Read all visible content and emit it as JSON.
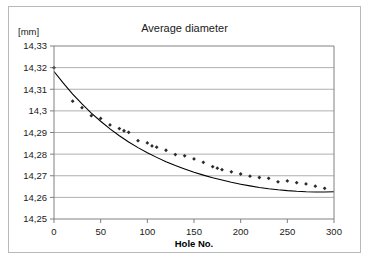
{
  "chart_data": {
    "type": "scatter",
    "title": "Average diameter",
    "xlabel": "Hole No.",
    "ylabel": "[mm]",
    "unit_label": "[mm]",
    "xlim": [
      0,
      300
    ],
    "ylim": [
      14.25,
      14.33
    ],
    "grid": "horizontal",
    "legend": "none",
    "x_ticks": [
      0,
      50,
      100,
      150,
      200,
      250,
      300
    ],
    "x_tick_labels": [
      "0",
      "50",
      "100",
      "150",
      "200",
      "250",
      "300"
    ],
    "y_ticks": [
      14.25,
      14.26,
      14.27,
      14.28,
      14.29,
      14.3,
      14.31,
      14.32,
      14.33
    ],
    "y_tick_labels": [
      "14,25",
      "14,26",
      "14,27",
      "14,28",
      "14,29",
      "14,3",
      "14,31",
      "14,32",
      "14,33"
    ],
    "decimal_separator": ",",
    "series": [
      {
        "name": "Average diameter measurements",
        "type": "scatter",
        "marker": "diamond",
        "color": "#2b2b2b",
        "x": [
          0,
          20,
          30,
          40,
          50,
          60,
          70,
          75,
          80,
          90,
          100,
          105,
          110,
          120,
          130,
          140,
          150,
          160,
          170,
          175,
          180,
          190,
          200,
          210,
          220,
          230,
          240,
          250,
          260,
          270,
          280,
          290
        ],
        "y": [
          14.32,
          14.3045,
          14.3015,
          14.2978,
          14.2965,
          14.2935,
          14.2918,
          14.2908,
          14.2901,
          14.2862,
          14.2852,
          14.2838,
          14.2832,
          14.2818,
          14.2798,
          14.2792,
          14.2778,
          14.2762,
          14.2742,
          14.2735,
          14.2728,
          14.2718,
          14.2708,
          14.2698,
          14.2692,
          14.2688,
          14.2672,
          14.2676,
          14.2668,
          14.2662,
          14.2652,
          14.2642
        ]
      },
      {
        "name": "Fitted trend curve",
        "type": "line",
        "color": "#000000",
        "x": [
          0,
          10,
          20,
          30,
          40,
          50,
          60,
          70,
          80,
          90,
          100,
          110,
          120,
          130,
          140,
          150,
          160,
          170,
          180,
          190,
          200,
          210,
          220,
          230,
          240,
          250,
          260,
          270,
          280,
          290,
          300
        ],
        "y": [
          14.3182,
          14.3128,
          14.3078,
          14.3032,
          14.299,
          14.2952,
          14.2917,
          14.2885,
          14.2856,
          14.283,
          14.2806,
          14.2785,
          14.2765,
          14.2747,
          14.2731,
          14.2716,
          14.2703,
          14.2691,
          14.268,
          14.267,
          14.2661,
          14.2653,
          14.2646,
          14.264,
          14.2635,
          14.2631,
          14.2628,
          14.2626,
          14.2625,
          14.2625,
          14.2626
        ]
      }
    ]
  },
  "style": {
    "plot_background": "#ffffff",
    "frame_border": "#b9b9b9",
    "gridline_color": "#9a9a9a",
    "axis_color": "#808080",
    "marker_color": "#2b2b2b",
    "curve_color": "#000000"
  }
}
